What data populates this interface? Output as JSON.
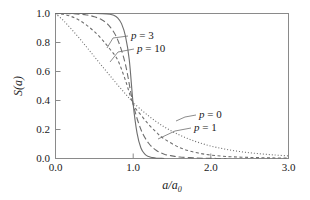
{
  "chart_data": {
    "type": "line",
    "title": "",
    "xlabel": "a/a_0",
    "xlabel_main": "a/a",
    "xlabel_sub": "0",
    "ylabel": "S(a)",
    "xlim": [
      0.0,
      3.0
    ],
    "ylim": [
      0.0,
      1.0
    ],
    "xticks": [
      "0.0",
      "1.0",
      "2.0",
      "3.0"
    ],
    "xtick_values": [
      0.0,
      1.0,
      2.0,
      3.0
    ],
    "yticks": [
      "0.0",
      "0.2",
      "0.4",
      "0.6",
      "0.8",
      "1.0"
    ],
    "ytick_values": [
      0.0,
      0.2,
      0.4,
      0.6,
      0.8,
      1.0
    ],
    "grid": false,
    "legend_position": "inline-annotations",
    "crossing_point": [
      1.0,
      0.37
    ],
    "series": [
      {
        "name": "p = 0",
        "p": 0,
        "linestyle": "dotted",
        "color": "#6e6e6e",
        "x": [
          0.0,
          0.1,
          0.2,
          0.3,
          0.4,
          0.5,
          0.6,
          0.7,
          0.8,
          0.9,
          1.0,
          1.2,
          1.4,
          1.6,
          1.8,
          2.0,
          2.2,
          2.4,
          2.6,
          2.8,
          3.0
        ],
        "values": [
          1.0,
          0.952,
          0.895,
          0.834,
          0.769,
          0.703,
          0.637,
          0.572,
          0.508,
          0.446,
          0.386,
          0.293,
          0.218,
          0.161,
          0.118,
          0.086,
          0.063,
          0.046,
          0.034,
          0.025,
          0.018
        ]
      },
      {
        "name": "p = 1",
        "p": 1,
        "linestyle": "dashed-short",
        "color": "#6e6e6e",
        "x": [
          0.0,
          0.1,
          0.2,
          0.3,
          0.4,
          0.5,
          0.6,
          0.7,
          0.8,
          0.9,
          1.0,
          1.1,
          1.2,
          1.3,
          1.4,
          1.6,
          1.8,
          2.0,
          2.2,
          2.4,
          2.6,
          2.8,
          3.0
        ],
        "values": [
          1.0,
          0.995,
          0.98,
          0.955,
          0.92,
          0.875,
          0.82,
          0.755,
          0.68,
          0.54,
          0.375,
          0.3,
          0.235,
          0.18,
          0.135,
          0.075,
          0.042,
          0.024,
          0.014,
          0.009,
          0.006,
          0.004,
          0.003
        ]
      },
      {
        "name": "p = 3",
        "p": 3,
        "linestyle": "dashed-long",
        "color": "#6e6e6e",
        "x": [
          0.0,
          0.1,
          0.2,
          0.3,
          0.4,
          0.5,
          0.6,
          0.7,
          0.8,
          0.9,
          1.0,
          1.1,
          1.2,
          1.3,
          1.4,
          1.5,
          1.6,
          1.8,
          2.0,
          2.2
        ],
        "values": [
          1.0,
          1.0,
          0.999,
          0.996,
          0.99,
          0.978,
          0.955,
          0.91,
          0.82,
          0.65,
          0.375,
          0.2,
          0.105,
          0.055,
          0.03,
          0.018,
          0.01,
          0.004,
          0.001,
          0.0
        ]
      },
      {
        "name": "p = 10",
        "p": 10,
        "linestyle": "solid",
        "color": "#3a3a3a",
        "x": [
          0.0,
          0.2,
          0.4,
          0.5,
          0.6,
          0.7,
          0.75,
          0.8,
          0.85,
          0.9,
          0.95,
          1.0,
          1.05,
          1.1,
          1.15,
          1.2,
          1.25,
          1.3,
          1.35,
          1.4
        ],
        "values": [
          1.0,
          1.0,
          1.0,
          1.0,
          0.999,
          0.995,
          0.988,
          0.97,
          0.93,
          0.845,
          0.68,
          0.375,
          0.175,
          0.072,
          0.03,
          0.013,
          0.006,
          0.002,
          0.001,
          0.0
        ]
      }
    ],
    "annotations": [
      {
        "text": "p = 3",
        "target_series": "p = 3",
        "x": 0.95,
        "y": 0.86
      },
      {
        "text": "p = 10",
        "target_series": "p = 10",
        "x": 1.05,
        "y": 0.74
      },
      {
        "text": "p = 0",
        "target_series": "p = 0",
        "x": 1.8,
        "y": 0.3
      },
      {
        "text": "p = 1",
        "target_series": "p = 1",
        "x": 1.72,
        "y": 0.195
      }
    ]
  },
  "labels": {
    "p0": "p = 0",
    "p1": "p = 1",
    "p3": "p = 3",
    "p10": "p = 10",
    "p_symbol": "p",
    "eq0": " = 0",
    "eq1": " = 1",
    "eq3": " = 3",
    "eq10": " = 10",
    "y_axis_s": "S",
    "y_axis_open": "(",
    "y_axis_a": "a",
    "y_axis_close": ")",
    "x_axis_a1": "a",
    "x_axis_slash": "/",
    "x_axis_a2": "a",
    "x_axis_zero": "0"
  },
  "ticks": {
    "x": [
      "0.0",
      "1.0",
      "2.0",
      "3.0"
    ],
    "y": [
      "0.0",
      "0.2",
      "0.4",
      "0.6",
      "0.8",
      "1.0"
    ]
  },
  "colors": {
    "frame": "#8a8a8a",
    "curve_light": "#6e6e6e",
    "curve_dark": "#3a3a3a",
    "text": "#1a1a1a",
    "background": "#ffffff"
  }
}
